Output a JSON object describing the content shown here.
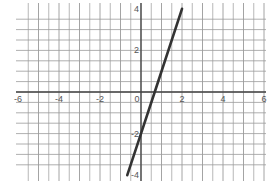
{
  "chart_data": {
    "type": "line",
    "title": "",
    "xlabel": "",
    "ylabel": "",
    "equation": "y = 3x - 2",
    "xlim": [
      -6,
      6
    ],
    "ylim": [
      -4,
      4
    ],
    "grid": true,
    "minor_grid_step": 0.5,
    "x_ticks": [
      "-6",
      "-4",
      "-2",
      "0",
      "2",
      "4",
      "6"
    ],
    "y_ticks": [
      "4",
      "2",
      "-2",
      "-4"
    ],
    "series": [
      {
        "name": "line",
        "x": [
          -0.67,
          0,
          0.67,
          2
        ],
        "y": [
          -4,
          -2,
          0,
          4
        ],
        "color": "#333333"
      }
    ]
  },
  "colors": {
    "grid": "#9a9a9a",
    "axis": "#444444",
    "line": "#333333",
    "label": "#555555"
  }
}
